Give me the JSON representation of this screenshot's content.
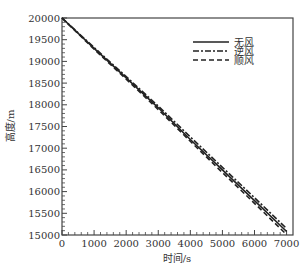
{
  "chart_data": {
    "type": "line",
    "title": "",
    "xlabel": "时间/s",
    "ylabel": "高度/m",
    "xlim": [
      0,
      7200
    ],
    "ylim": [
      15000,
      20000
    ],
    "xticks": [
      0,
      1000,
      2000,
      3000,
      4000,
      5000,
      6000,
      7000
    ],
    "yticks": [
      15000,
      15500,
      16000,
      16500,
      17000,
      17500,
      18000,
      18500,
      19000,
      19500,
      20000
    ],
    "grid": false,
    "legend_position": "upper right",
    "x": [
      0,
      1000,
      2000,
      3000,
      4000,
      5000,
      6000,
      7000
    ],
    "series": [
      {
        "name": "无风",
        "style": "solid",
        "values": [
          20000,
          19300,
          18620,
          17930,
          17200,
          16500,
          15790,
          15080
        ]
      },
      {
        "name": "逆风",
        "style": "dashdot",
        "values": [
          20000,
          19320,
          18650,
          17970,
          17260,
          16560,
          15860,
          15150
        ]
      },
      {
        "name": "顺风",
        "style": "dashed",
        "values": [
          20000,
          19280,
          18590,
          17890,
          17160,
          16440,
          15730,
          15010
        ]
      }
    ]
  }
}
